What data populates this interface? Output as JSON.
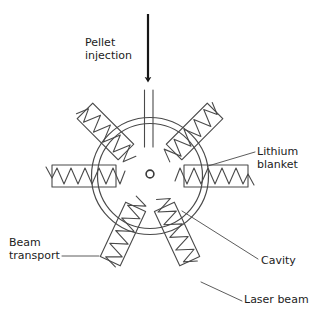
{
  "figure": {
    "background_color": "#ffffff",
    "line_color": "#4a4a4a",
    "arrow_color": "#161616",
    "text_color": "#1c1c1c"
  },
  "labels": {
    "pellet_injection": {
      "line1": "Pellet",
      "line2": "injection"
    },
    "lithium_blanket": {
      "line1": "Lithium",
      "line2": "blanket"
    },
    "beam_transport": {
      "line1": "Beam",
      "line2": "transport"
    },
    "cavity": {
      "line1": "Cavity"
    },
    "laser_beam": {
      "line1": "Laser beam"
    }
  },
  "geometry": {
    "chamber_center_x": 150,
    "chamber_center_y": 176,
    "chamber_outer_radius": 58,
    "chamber_inner_radius": 52,
    "target_x": 150,
    "target_y": 174,
    "target_radius": 4,
    "injection_arrow_x": 148,
    "injection_arrow_top_y": 14,
    "injection_arrow_tip_y": 84,
    "injection_tube_left_x": 144,
    "injection_tube_right_x": 153,
    "injection_tube_top_y": 90,
    "injection_tube_bottom_y": 146,
    "beam_count": 6,
    "beam_angles_deg": [
      135,
      45,
      180,
      0,
      225,
      315
    ]
  }
}
